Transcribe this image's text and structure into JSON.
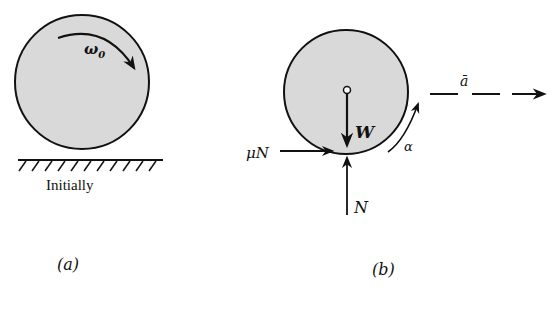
{
  "figure": {
    "panel_a": {
      "omega_label": "ω",
      "omega_sub": "0",
      "ground_label": "Initially",
      "caption": "(a)"
    },
    "panel_b": {
      "weight_label": "W",
      "friction_label": "μN",
      "normal_label": "N",
      "alpha_label": "α",
      "accel_label": "ā",
      "caption": "(b)"
    }
  },
  "colors": {
    "disk_fill": "#d9d9d9",
    "stroke": "#111111"
  }
}
